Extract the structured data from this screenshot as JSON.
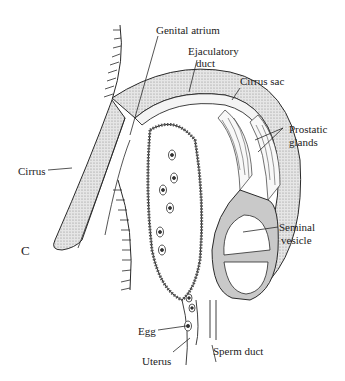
{
  "figure": {
    "panel_letter": "C"
  },
  "labels": {
    "genital_atrium": "Genital atrium",
    "ejaculatory_duct_1": "Ejaculatory",
    "ejaculatory_duct_2": "duct",
    "cirrus_sac": "Cirrus sac",
    "prostatic_glands_1": "Prostatic",
    "prostatic_glands_2": "glands",
    "cirrus": "Cirrus",
    "seminal_vesicle_1": "Seminal",
    "seminal_vesicle_2": "vesicle",
    "egg": "Egg",
    "uterus": "Uterus",
    "sperm_duct": "Sperm duct"
  },
  "colors": {
    "line": "#2a2a2a",
    "stipple": "#d6d6d6",
    "stipple_dark": "#bdbdbd",
    "background": "#ffffff"
  }
}
